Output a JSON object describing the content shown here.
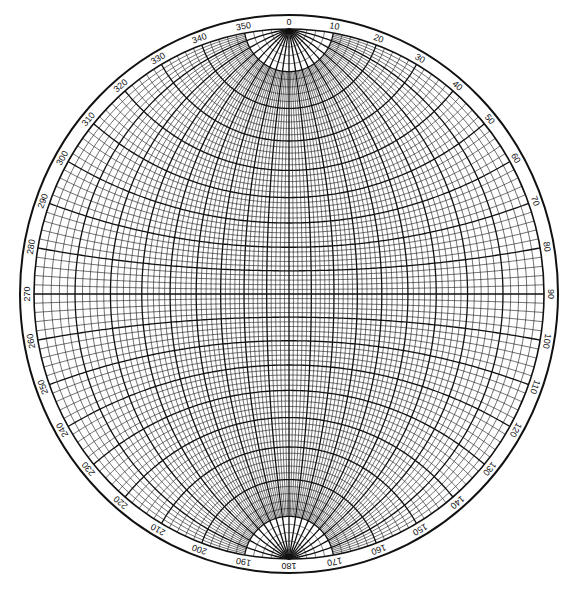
{
  "diagram": {
    "type": "stereonet",
    "projection": "stereographic (Wulff equal-angle net)",
    "fine_interval_deg": 2,
    "bold_interval_deg": 10,
    "polar_cap_latitude_deg": 80,
    "geometry": {
      "center_x": 289,
      "center_y": 294,
      "outer_rx": 269,
      "outer_ry": 279,
      "ring_width": 14
    },
    "colors": {
      "line": "#111111",
      "background": "#ffffff"
    },
    "azimuth_labels": [
      "0",
      "10",
      "20",
      "30",
      "40",
      "50",
      "60",
      "70",
      "80",
      "90",
      "100",
      "110",
      "120",
      "130",
      "140",
      "150",
      "160",
      "170",
      "180",
      "190",
      "200",
      "210",
      "220",
      "230",
      "240",
      "250",
      "260",
      "270",
      "280",
      "290",
      "300",
      "310",
      "320",
      "330",
      "340",
      "350"
    ]
  }
}
